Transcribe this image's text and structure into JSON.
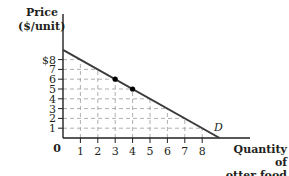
{
  "chart_data": {
    "type": "line",
    "title": "",
    "xlabel": "Quantity of otter food",
    "ylabel": "Price ($/unit)",
    "xlim": [
      0,
      9
    ],
    "ylim": [
      0,
      9
    ],
    "x_ticks": [
      "1",
      "2",
      "3",
      "4",
      "5",
      "6",
      "7",
      "8"
    ],
    "y_ticks": [
      "1",
      "2",
      "3",
      "4",
      "5",
      "6",
      "7",
      "$8"
    ],
    "origin_label": "0",
    "grid": "dashed",
    "series": [
      {
        "name": "D",
        "x": [
          0,
          9
        ],
        "y": [
          9,
          0
        ]
      }
    ],
    "highlighted_points": [
      {
        "x": 3,
        "y": 6
      },
      {
        "x": 4,
        "y": 5
      }
    ],
    "annotations": [
      {
        "text": "D",
        "x": 8.6,
        "y": 1.1
      }
    ]
  },
  "labels": {
    "y_title_line1": "Price",
    "y_title_line2": "($/unit)",
    "x_title_line1": "Quantity of",
    "x_title_line2": "otter food",
    "curve": "D"
  },
  "colors": {
    "axis": "#231f20",
    "grid": "#9a9a9a",
    "line": "#3a3a3a",
    "point": "#000000"
  }
}
